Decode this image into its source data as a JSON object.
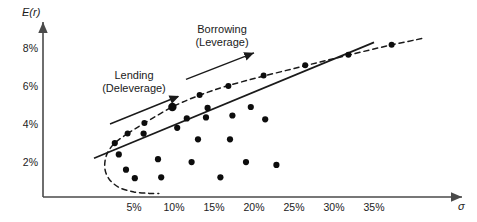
{
  "chart_data": {
    "type": "scatter",
    "title": "",
    "xlabel": "σ",
    "ylabel": "E(r)",
    "xlim": [
      0,
      42
    ],
    "ylim": [
      0,
      9.2
    ],
    "grid": false,
    "legend_position": "none",
    "x_tick_labels": [
      "5%",
      "10%",
      "15%",
      "20%",
      "25%",
      "30%",
      "35%"
    ],
    "x_tick_values": [
      5,
      10,
      15,
      20,
      25,
      30,
      35
    ],
    "y_tick_labels": [
      "2%",
      "4%",
      "6%",
      "8%"
    ],
    "y_tick_values": [
      2,
      4,
      6,
      8
    ],
    "annotations": [
      {
        "name": "lending-annotation",
        "line1": "Lending",
        "line2": "(Deleverage)",
        "text_x": 5.0,
        "text_y": 6.6,
        "arrow_from": [
          10.5,
          5.5
        ],
        "arrow_to": [
          2.0,
          4.05
        ],
        "arrow_head": "start"
      },
      {
        "name": "borrowing-annotation",
        "line1": "Borrowing",
        "line2": "(Leverage)",
        "text_x": 16.0,
        "text_y": 9.0,
        "arrow_from": [
          11.5,
          6.4
        ],
        "arrow_to": [
          20.0,
          7.8
        ],
        "arrow_head": "end"
      }
    ],
    "capital_allocation_line": {
      "name": "capital-allocation-line",
      "style": "solid",
      "x_start": 0.0,
      "y_start": 2.25,
      "x_end": 35.0,
      "y_end": 8.35
    },
    "efficient_frontier": {
      "name": "efficient-frontier-curve",
      "style": "dashed",
      "points": [
        [
          4.2,
          3.55
        ],
        [
          2.6,
          3.05
        ],
        [
          1.6,
          2.45
        ],
        [
          1.35,
          1.75
        ],
        [
          1.9,
          1.15
        ],
        [
          3.2,
          0.7
        ],
        [
          5.0,
          0.48
        ],
        [
          6.9,
          0.4
        ],
        [
          8.1,
          0.4
        ]
      ],
      "upper_points": [
        [
          4.2,
          3.55
        ],
        [
          6.3,
          4.1
        ],
        [
          9.8,
          4.95
        ],
        [
          13.1,
          5.55
        ],
        [
          16.6,
          6.05
        ],
        [
          21.0,
          6.55
        ],
        [
          26.2,
          7.1
        ],
        [
          31.5,
          7.65
        ],
        [
          37.0,
          8.2
        ],
        [
          41.0,
          8.55
        ]
      ]
    },
    "tangency_point": {
      "name": "tangency-portfolio-point",
      "x": 9.8,
      "y": 4.95
    },
    "frontier_markers": [
      {
        "x": 4.2,
        "y": 3.55
      },
      {
        "x": 6.3,
        "y": 4.1
      },
      {
        "x": 13.2,
        "y": 5.58
      },
      {
        "x": 16.8,
        "y": 6.05
      },
      {
        "x": 21.2,
        "y": 6.6
      },
      {
        "x": 26.4,
        "y": 7.15
      },
      {
        "x": 31.8,
        "y": 7.7
      },
      {
        "x": 37.2,
        "y": 8.22
      }
    ],
    "assets": [
      {
        "x": 2.6,
        "y": 3.05
      },
      {
        "x": 3.1,
        "y": 2.45
      },
      {
        "x": 4.0,
        "y": 1.65
      },
      {
        "x": 5.1,
        "y": 1.2
      },
      {
        "x": 6.2,
        "y": 3.55
      },
      {
        "x": 8.0,
        "y": 2.2
      },
      {
        "x": 8.4,
        "y": 1.25
      },
      {
        "x": 10.4,
        "y": 3.85
      },
      {
        "x": 11.6,
        "y": 4.35
      },
      {
        "x": 12.2,
        "y": 2.05
      },
      {
        "x": 13.0,
        "y": 3.25
      },
      {
        "x": 14.0,
        "y": 4.4
      },
      {
        "x": 14.2,
        "y": 4.9
      },
      {
        "x": 15.8,
        "y": 1.25
      },
      {
        "x": 17.0,
        "y": 3.25
      },
      {
        "x": 17.3,
        "y": 4.5
      },
      {
        "x": 19.0,
        "y": 2.05
      },
      {
        "x": 19.6,
        "y": 4.95
      },
      {
        "x": 21.4,
        "y": 4.3
      },
      {
        "x": 22.8,
        "y": 1.9
      }
    ]
  }
}
